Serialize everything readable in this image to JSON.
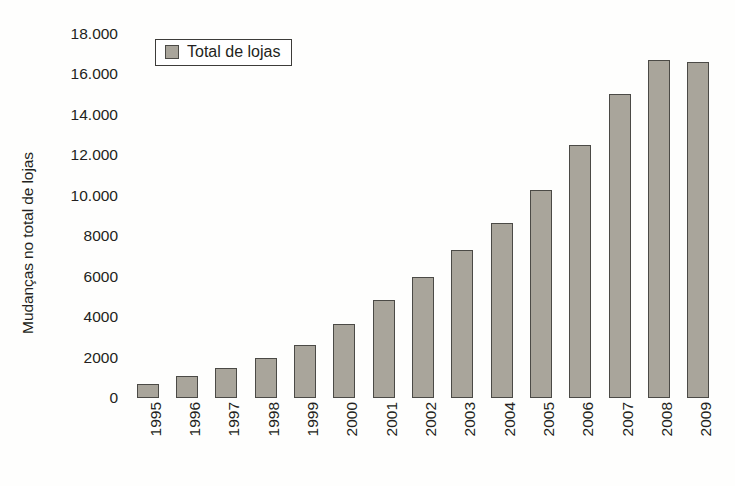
{
  "chart_data": {
    "type": "bar",
    "title": "",
    "subtitle": "",
    "xlabel": "",
    "ylabel": "Mudanças no total de lojas",
    "categories": [
      "1995",
      "1996",
      "1997",
      "1998",
      "1999",
      "2000",
      "2001",
      "2002",
      "2003",
      "2004",
      "2005",
      "2006",
      "2007",
      "2008",
      "2009"
    ],
    "series": [
      {
        "name": "Total de lojas",
        "values": [
          700,
          1100,
          1500,
          2000,
          2600,
          3650,
          4850,
          6000,
          7300,
          8650,
          10300,
          12500,
          15050,
          16700,
          16600
        ]
      }
    ],
    "ylim": [
      0,
      18000
    ],
    "ytick_values": [
      0,
      2000,
      4000,
      6000,
      8000,
      10000,
      12000,
      14000,
      16000,
      18000
    ],
    "ytick_labels": [
      "0",
      "2000",
      "4000",
      "6000",
      "8000",
      "10.000",
      "12.000",
      "14.000",
      "16.000",
      "18.000"
    ],
    "grid": false,
    "legend_position": "top-left",
    "legend_entries": [
      "Total de lojas"
    ],
    "annotations": []
  },
  "legend": {
    "label": "Total de lojas",
    "swatch_name": "legend-color-swatch"
  },
  "colors": {
    "bar_fill": "#a9a59b",
    "bar_border": "#4b4a46",
    "text": "#231f20",
    "background": "#fefefd",
    "legend_border": "#3d3c39"
  }
}
